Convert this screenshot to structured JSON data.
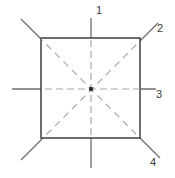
{
  "figure": {
    "canvas": {
      "width": 175,
      "height": 178,
      "background": "#ffffff"
    },
    "colors": {
      "square_stroke": "#4a4a4a",
      "centerline_outside": "#6e6e6e",
      "centerline_inside": "#a8a8a8",
      "diagonal_outside": "#6e6e6e",
      "diagonal_inside": "#a8a8a8",
      "center_dot": "#2b2b2b",
      "label_text": "#3a3a3a"
    },
    "square": {
      "name": "square-outline",
      "x": 41,
      "y": 38,
      "width": 99,
      "height": 100,
      "stroke_width": 1.6
    },
    "center": {
      "name": "center-point",
      "x": 91,
      "y": 89,
      "radius": 2.2
    },
    "lines": [
      {
        "name": "vertical-centerline",
        "kind": "centerline",
        "orientation": "vertical",
        "x1": 91,
        "y1": 18,
        "x2": 91,
        "y2": 168,
        "dashed_inside": true
      },
      {
        "name": "horizontal-centerline",
        "kind": "centerline",
        "orientation": "horizontal",
        "x1": 12,
        "y1": 89,
        "x2": 156,
        "y2": 89,
        "dashed_inside": true
      },
      {
        "name": "diagonal-tl-br",
        "kind": "diagonal",
        "orientation": "descending",
        "x1": 21,
        "y1": 19,
        "x2": 160,
        "y2": 158,
        "dashed_inside": true
      },
      {
        "name": "diagonal-bl-tr",
        "kind": "diagonal",
        "orientation": "ascending",
        "x1": 21,
        "y1": 160,
        "x2": 158,
        "y2": 23,
        "dashed_inside": true
      }
    ],
    "labels": [
      {
        "name": "axis-label-1",
        "text": "1",
        "x": 96,
        "y": 14,
        "anchor": "start",
        "points_to": "vertical-centerline-top"
      },
      {
        "name": "axis-label-2",
        "text": "2",
        "x": 157,
        "y": 32,
        "anchor": "start",
        "points_to": "diagonal-bl-tr-top-right"
      },
      {
        "name": "axis-label-3",
        "text": "3",
        "x": 156,
        "y": 98,
        "anchor": "start",
        "points_to": "horizontal-centerline-right"
      },
      {
        "name": "axis-label-4",
        "text": "4",
        "x": 150,
        "y": 166,
        "anchor": "start",
        "points_to": "diagonal-tl-br-bottom-right"
      }
    ]
  }
}
